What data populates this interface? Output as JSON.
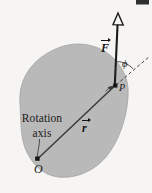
{
  "figure": {
    "kind": "physics-diagram",
    "caption_labels": {
      "rotation_line1": "Rotation",
      "rotation_line2": "axis",
      "origin": "O",
      "point": "P",
      "angle": "ϕ",
      "force_vector": "F",
      "position_vector": "r"
    },
    "colors": {
      "background": "#f6f5f3",
      "body_fill": "#b9b9b9",
      "body_stroke": "#9a9a9a",
      "ink": "#1a1a1a",
      "corner_mark": "#2b2b2b"
    },
    "geometry": {
      "origin_point": {
        "x": 37,
        "y": 160
      },
      "contact_point": {
        "x": 115,
        "y": 86
      },
      "force_tip": {
        "x": 118,
        "y": 16
      },
      "dashed_reference_tip": {
        "x": 150,
        "y": 57
      },
      "angle_degrees": 28
    }
  }
}
